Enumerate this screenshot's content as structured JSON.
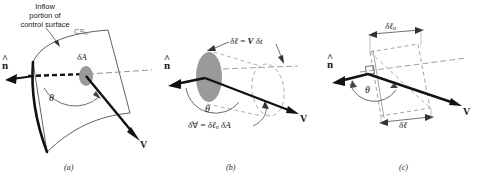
{
  "figure": {
    "background_color": "#ffffff",
    "ink_color": "#1a1a1a",
    "area_fill_color": "#9a9a9a",
    "width": 479,
    "height": 182
  },
  "panels": [
    {
      "id": "a",
      "caption": "(a)",
      "labels": {
        "callout_line1": "Inflow",
        "callout_line2": "portion of",
        "callout_line3": "control surface",
        "cs_symbol": "CS",
        "cs_subscript": "in",
        "area_delta": "δ",
        "area_symbol": "A",
        "angle": "θ",
        "normal_vector": "n",
        "velocity_vector": "V"
      }
    },
    {
      "id": "b",
      "caption": "(b)",
      "labels": {
        "length_delta": "δ",
        "length_symbol": "ℓ",
        "length_equals": " = ",
        "length_rhs_v": "V",
        "length_rhs_delta": " δ",
        "length_rhs_t": "t",
        "volume_delta": "δ",
        "volume_symbol": "∀",
        "volume_equals": " = ",
        "volume_rhs_delta": "δ",
        "volume_rhs_l": "ℓ",
        "volume_rhs_sub": "n",
        "volume_rhs_delta2": " δ",
        "volume_rhs_a": "A",
        "angle": "θ",
        "normal_vector": "n",
        "velocity_vector": "V"
      }
    },
    {
      "id": "c",
      "caption": "(c)",
      "labels": {
        "ln_delta": "δ",
        "ln_symbol": "ℓ",
        "ln_subscript": "n",
        "l_delta": "δ",
        "l_symbol": "ℓ",
        "angle": "θ",
        "normal_vector": "n",
        "velocity_vector": "V"
      }
    }
  ]
}
